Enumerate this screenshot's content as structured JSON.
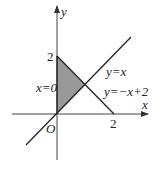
{
  "diagram": {
    "axes": {
      "x_label": "x",
      "y_label": "y",
      "origin_label": "O"
    },
    "ticks": {
      "x_tick": "2",
      "y_tick": "2"
    },
    "lines": [
      {
        "label": "y=x"
      },
      {
        "label": "y=−x+2"
      },
      {
        "label": "x=0"
      }
    ],
    "shaded_region": {
      "vertices": [
        [
          0,
          0
        ],
        [
          0,
          2
        ],
        [
          1,
          1
        ]
      ],
      "fill": "#999999"
    }
  }
}
